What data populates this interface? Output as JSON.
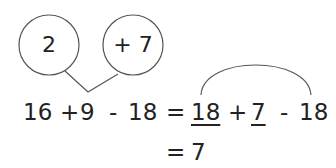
{
  "diagram": {
    "circles": [
      {
        "label": "2"
      },
      {
        "label": "+ 7"
      }
    ],
    "line1": {
      "tokens": [
        "16",
        "+",
        "9",
        "-",
        "18",
        "=",
        "18",
        "+",
        "7",
        "-",
        "18"
      ],
      "underlined": [
        6,
        8
      ]
    },
    "line2": {
      "tokens": [
        "=",
        "7"
      ]
    },
    "colors": {
      "stroke": "#555555",
      "text": "#222222"
    }
  }
}
